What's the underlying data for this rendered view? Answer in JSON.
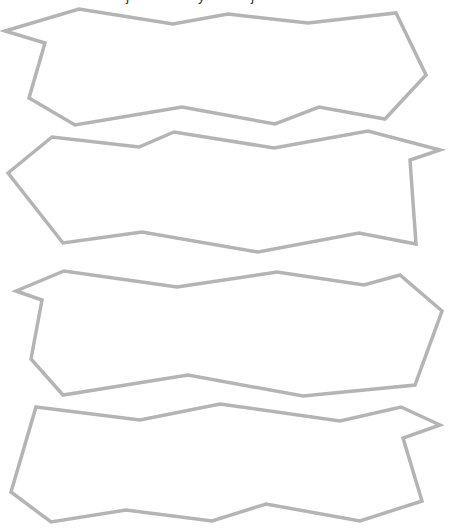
{
  "stroke_color": "#b4b4b4",
  "stroke_width": 3.5,
  "shapes": [
    {
      "name": "torn-paper-shape-1",
      "points": "5,31 79,9 173,24 228,14 308,23 396,13 426,75 385,119 319,107 275,124 182,107 75,125 29,98 45,43"
    },
    {
      "name": "torn-paper-shape-2",
      "points": "8,173 52,137 139,147 174,132 274,148 368,131 440,150 410,160 416,244 359,233 258,252 142,232 63,243"
    },
    {
      "name": "torn-paper-shape-3",
      "points": "16,291 64,271 177,287 277,272 364,285 400,275 442,311 415,385 303,396 188,375 63,395 31,359 42,300"
    },
    {
      "name": "torn-paper-shape-4",
      "points": "36,407 140,420 220,404 340,421 401,407 440,425 403,438 422,501 360,521 266,504 212,521 126,510 51,522 11,492"
    }
  ]
}
